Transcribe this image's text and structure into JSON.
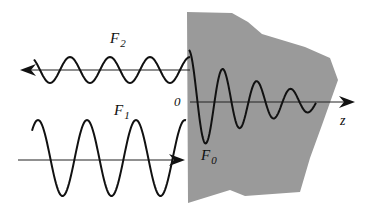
{
  "diagram": {
    "type": "wave-reflection-transmission",
    "medium": {
      "fill": "#9a9a9a",
      "points": "187,12 232,13 248,22 262,34 305,47 330,58 338,80 322,125 310,158 300,192 245,196 230,190 188,203"
    },
    "waves": {
      "reflected": {
        "label": "F",
        "subscript": "2",
        "direction": "left",
        "axis": {
          "x1": 190,
          "x2": 20,
          "y": 70
        },
        "amplitude": 13,
        "period": 40,
        "x_start": 34,
        "x_end": 190
      },
      "incident": {
        "label": "F",
        "subscript": "1",
        "direction": "right",
        "axis": {
          "x1": 18,
          "x2": 183,
          "y": 160
        },
        "amplitude": 38,
        "center_y": 158,
        "period": 49,
        "x_start": 32,
        "x_end": 186
      },
      "transmitted": {
        "label": "F",
        "subscript": "0",
        "direction": "right",
        "axis": {
          "x1": 190,
          "x2": 355,
          "y": 102
        },
        "decaying": true,
        "x_start": 189,
        "x_end": 316
      }
    },
    "labels": {
      "F2": {
        "text": "F",
        "sub": "2",
        "x": 110,
        "y": 43
      },
      "F1": {
        "text": "F",
        "sub": "1",
        "x": 114,
        "y": 115
      },
      "F0": {
        "text": "F",
        "sub": "0",
        "x": 201,
        "y": 160
      },
      "origin": {
        "text": "0",
        "x": 174,
        "y": 106
      },
      "z_axis": {
        "text": "z",
        "x": 340,
        "y": 125
      }
    },
    "colors": {
      "line": "#111111",
      "medium": "#9a9a9a",
      "background": "#ffffff"
    }
  }
}
